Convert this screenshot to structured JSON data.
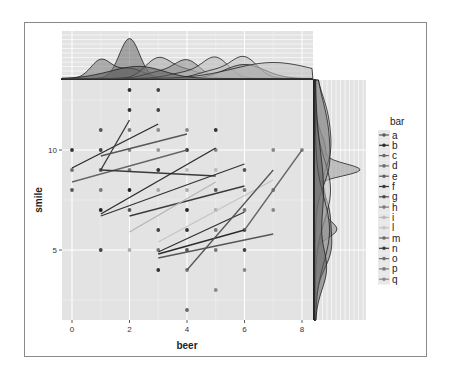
{
  "chart_data": {
    "type": "scatter",
    "title": "",
    "xlabel": "beer",
    "ylabel": "smile",
    "xlim": [
      -0.4,
      8.4
    ],
    "ylim": [
      1.5,
      13.5
    ],
    "x_ticks": [
      0,
      2,
      4,
      6,
      8
    ],
    "y_ticks": [
      5,
      10
    ],
    "grid": true,
    "legend": {
      "title": "bar",
      "position": "right",
      "entries": [
        "a",
        "b",
        "c",
        "d",
        "e",
        "f",
        "g",
        "h",
        "i",
        "l",
        "m",
        "n",
        "o",
        "p",
        "q"
      ]
    },
    "points": [
      {
        "x": 0,
        "y": 10,
        "c": "#333333"
      },
      {
        "x": 0,
        "y": 9,
        "c": "#6e6e6e"
      },
      {
        "x": 0,
        "y": 8,
        "c": "#555555"
      },
      {
        "x": 1,
        "y": 11,
        "c": "#555555"
      },
      {
        "x": 1,
        "y": 10,
        "c": "#444444"
      },
      {
        "x": 1,
        "y": 9,
        "c": "#555555"
      },
      {
        "x": 1,
        "y": 8,
        "c": "#777777"
      },
      {
        "x": 1,
        "y": 7,
        "c": "#222222"
      },
      {
        "x": 1,
        "y": 5,
        "c": "#444444"
      },
      {
        "x": 2,
        "y": 13,
        "c": "#333333"
      },
      {
        "x": 2,
        "y": 12,
        "c": "#333333"
      },
      {
        "x": 2,
        "y": 11,
        "c": "#777777"
      },
      {
        "x": 2,
        "y": 10,
        "c": "#888888"
      },
      {
        "x": 2,
        "y": 9,
        "c": "#777777"
      },
      {
        "x": 2,
        "y": 8,
        "c": "#222222"
      },
      {
        "x": 2,
        "y": 7,
        "c": "#555555"
      },
      {
        "x": 2,
        "y": 5,
        "c": "#aaaaaa"
      },
      {
        "x": 3,
        "y": 13,
        "c": "#444444"
      },
      {
        "x": 3,
        "y": 12,
        "c": "#444444"
      },
      {
        "x": 3,
        "y": 11,
        "c": "#888888"
      },
      {
        "x": 3,
        "y": 10,
        "c": "#999999"
      },
      {
        "x": 3,
        "y": 9,
        "c": "#333333"
      },
      {
        "x": 3,
        "y": 8,
        "c": "#aaaaaa"
      },
      {
        "x": 3,
        "y": 6,
        "c": "#444444"
      },
      {
        "x": 3,
        "y": 5,
        "c": "#777777"
      },
      {
        "x": 3,
        "y": 4,
        "c": "#333333"
      },
      {
        "x": 4,
        "y": 11,
        "c": "#888888"
      },
      {
        "x": 4,
        "y": 10,
        "c": "#333333"
      },
      {
        "x": 4,
        "y": 9,
        "c": "#bbbbbb"
      },
      {
        "x": 4,
        "y": 8,
        "c": "#aaaaaa"
      },
      {
        "x": 4,
        "y": 7,
        "c": "#222222"
      },
      {
        "x": 4,
        "y": 6,
        "c": "#333333"
      },
      {
        "x": 4,
        "y": 5,
        "c": "#555555"
      },
      {
        "x": 4,
        "y": 4,
        "c": "#777777"
      },
      {
        "x": 4,
        "y": 2,
        "c": "#666666"
      },
      {
        "x": 5,
        "y": 11,
        "c": "#333333"
      },
      {
        "x": 5,
        "y": 10,
        "c": "#888888"
      },
      {
        "x": 5,
        "y": 9,
        "c": "#bbbbbb"
      },
      {
        "x": 5,
        "y": 8,
        "c": "#555555"
      },
      {
        "x": 5,
        "y": 7,
        "c": "#aaaaaa"
      },
      {
        "x": 5,
        "y": 6,
        "c": "#777777"
      },
      {
        "x": 5,
        "y": 5,
        "c": "#777777"
      },
      {
        "x": 5,
        "y": 3,
        "c": "#888888"
      },
      {
        "x": 6,
        "y": 9,
        "c": "#555555"
      },
      {
        "x": 6,
        "y": 8,
        "c": "#777777"
      },
      {
        "x": 6,
        "y": 7,
        "c": "#777777"
      },
      {
        "x": 6,
        "y": 6,
        "c": "#555555"
      },
      {
        "x": 6,
        "y": 5,
        "c": "#444444"
      },
      {
        "x": 6,
        "y": 4,
        "c": "#888888"
      },
      {
        "x": 7,
        "y": 10,
        "c": "#888888"
      },
      {
        "x": 7,
        "y": 8,
        "c": "#777777"
      },
      {
        "x": 7,
        "y": 7,
        "c": "#888888"
      },
      {
        "x": 8,
        "y": 10,
        "c": "#888888"
      }
    ],
    "fit_lines": [
      {
        "x1": 0,
        "y1": 9.1,
        "x2": 3,
        "y2": 11.3,
        "c": "#2a2a2a"
      },
      {
        "x1": 1,
        "y1": 9.0,
        "x2": 2,
        "y2": 11.5,
        "c": "#3a3a3a"
      },
      {
        "x1": 1,
        "y1": 9.7,
        "x2": 4,
        "y2": 10.8,
        "c": "#555555"
      },
      {
        "x1": 0,
        "y1": 8.4,
        "x2": 4,
        "y2": 10.0,
        "c": "#666666"
      },
      {
        "x1": 1,
        "y1": 9.0,
        "x2": 5,
        "y2": 8.7,
        "c": "#3a3a3a"
      },
      {
        "x1": 1,
        "y1": 6.8,
        "x2": 5,
        "y2": 10.1,
        "c": "#2a2a2a"
      },
      {
        "x1": 1,
        "y1": 6.7,
        "x2": 6,
        "y2": 9.3,
        "c": "#333333"
      },
      {
        "x1": 2,
        "y1": 6.7,
        "x2": 6,
        "y2": 8.2,
        "c": "#3a3a3a"
      },
      {
        "x1": 2,
        "y1": 5.9,
        "x2": 5,
        "y2": 8.4,
        "c": "#b5b5b5"
      },
      {
        "x1": 3,
        "y1": 5.4,
        "x2": 7,
        "y2": 8.5,
        "c": "#c5c5c5"
      },
      {
        "x1": 3,
        "y1": 4.9,
        "x2": 6,
        "y2": 6.9,
        "c": "#333333"
      },
      {
        "x1": 3,
        "y1": 4.8,
        "x2": 6,
        "y2": 6.0,
        "c": "#2a2a2a"
      },
      {
        "x1": 3,
        "y1": 4.6,
        "x2": 7,
        "y2": 5.8,
        "c": "#555555"
      },
      {
        "x1": 4,
        "y1": 4.0,
        "x2": 7,
        "y2": 9.0,
        "c": "#555555"
      },
      {
        "x1": 6,
        "y1": 6.0,
        "x2": 8,
        "y2": 10.0,
        "c": "#666666"
      }
    ],
    "marginals": {
      "top": "density of beer per bar group",
      "right": "density of smile per bar group"
    }
  },
  "colors": {
    "panel_bg": "#e3e3e3",
    "grid_major": "#ffffff",
    "frame_border": "#8a8a8a"
  }
}
